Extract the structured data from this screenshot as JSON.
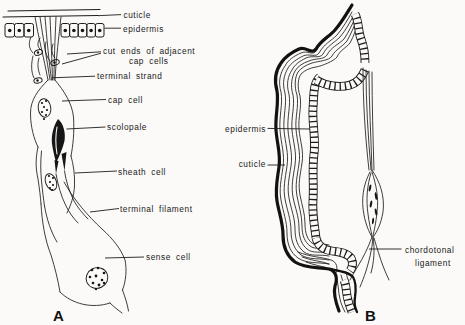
{
  "figure": {
    "background_color": "#fbfaf8",
    "ink_color": "#1d1c1a",
    "panel_a": {
      "panel_letter": "A",
      "labels": {
        "cuticle": "cuticle",
        "epidermis": "epidermis",
        "cut_ends_line1": "cut ends of adjacent",
        "cut_ends_line2": "cap cells",
        "terminal_strand": "terminal strand",
        "cap_cell": "cap cell",
        "scolopale": "scolopale",
        "sheath_cell": "sheath cell",
        "terminal_filament": "terminal filament",
        "sense_cell": "sense cell"
      }
    },
    "panel_b": {
      "panel_letter": "B",
      "labels": {
        "epidermis": "epidermis",
        "cuticle": "cuticle",
        "ligament_line1": "chordotonal",
        "ligament_line2": "ligament"
      }
    }
  }
}
